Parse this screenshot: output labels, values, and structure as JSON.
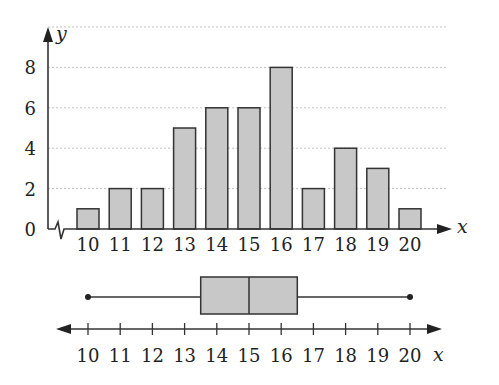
{
  "chart_data": [
    {
      "type": "bar",
      "title": "",
      "xlabel": "x",
      "ylabel": "y",
      "categories": [
        "10",
        "11",
        "12",
        "13",
        "14",
        "15",
        "16",
        "17",
        "18",
        "19",
        "20"
      ],
      "values": [
        1,
        2,
        2,
        5,
        6,
        6,
        8,
        2,
        4,
        3,
        1
      ],
      "y_ticks": [
        "0",
        "2",
        "4",
        "6",
        "8"
      ],
      "ylim": [
        0,
        10
      ],
      "grid": "horizontal dashed",
      "axis_break": "x-axis broken near origin",
      "bar_color": "#c8c8c8",
      "bar_edge_color": "#333333"
    },
    {
      "type": "boxplot",
      "xlabel": "x",
      "tick_labels": [
        "10",
        "11",
        "12",
        "13",
        "14",
        "15",
        "16",
        "17",
        "18",
        "19",
        "20"
      ],
      "min": 10,
      "q1": 13.5,
      "median": 15,
      "q3": 16.5,
      "max": 20,
      "axis": "number line with arrows both ends",
      "box_color": "#c8c8c8"
    }
  ],
  "labels": {
    "y_axis": "y",
    "x_axis_hist": "x",
    "x_axis_box": "x"
  }
}
